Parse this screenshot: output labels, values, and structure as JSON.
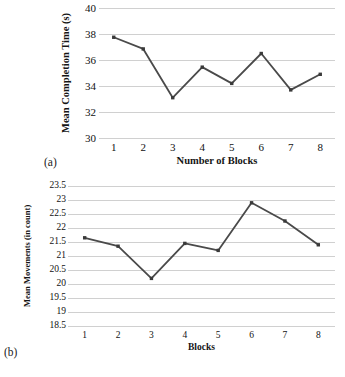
{
  "figure": {
    "panel_a_tag": "(a)",
    "panel_b_tag": "(b)"
  },
  "chart_data": [
    {
      "id": "a",
      "type": "line",
      "title": "",
      "xlabel": "Number of Blocks",
      "ylabel": "Mean Completion Time (s)",
      "categories": [
        "1",
        "2",
        "3",
        "4",
        "5",
        "6",
        "7",
        "8"
      ],
      "values": [
        37.75,
        36.85,
        33.1,
        35.45,
        34.2,
        36.5,
        33.7,
        34.9
      ],
      "yticks": [
        40,
        38,
        36,
        34,
        32,
        30
      ],
      "ytick_labels": [
        "40",
        "38",
        "36",
        "34",
        "32",
        "30"
      ],
      "ylim": [
        30,
        40
      ],
      "grid": true,
      "legend": "none",
      "line_color": "#4a4a4a",
      "marker_color": "#3a3a3a"
    },
    {
      "id": "b",
      "type": "line",
      "title": "",
      "xlabel": "Blocks",
      "ylabel": "Mean Movements (in count)",
      "categories": [
        "1",
        "2",
        "3",
        "4",
        "5",
        "6",
        "7",
        "8"
      ],
      "values": [
        21.65,
        21.35,
        20.2,
        21.45,
        21.2,
        22.9,
        22.25,
        21.4
      ],
      "yticks": [
        23.5,
        23,
        22.5,
        22,
        21.5,
        21,
        20.5,
        20,
        19.5,
        19,
        18.5
      ],
      "ytick_labels": [
        "23.5",
        "23",
        "22.5",
        "22",
        "21.5",
        "21",
        "20.5",
        "20",
        "19.5",
        "19",
        "18.5"
      ],
      "ylim": [
        18.5,
        23.5
      ],
      "grid": true,
      "legend": "none",
      "line_color": "#4a4a4a",
      "marker_color": "#3a3a3a"
    }
  ]
}
